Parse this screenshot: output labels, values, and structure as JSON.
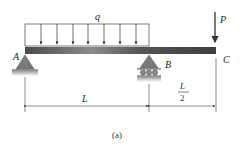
{
  "diagram": {
    "type": "beam-with-overhang",
    "distributed_load": {
      "label": "q",
      "from": "A",
      "to": "B"
    },
    "point_load": {
      "label": "P",
      "at": "C",
      "direction": "down"
    },
    "supports": [
      {
        "label": "A",
        "type": "pin"
      },
      {
        "label": "B",
        "type": "roller"
      }
    ],
    "free_end": {
      "label": "C"
    },
    "dimensions": [
      {
        "span": "A-B",
        "label": "L"
      },
      {
        "span": "B-C",
        "numerator": "L",
        "denominator": "2"
      }
    ],
    "caption": "(a)"
  },
  "colors": {
    "beam": "#555555",
    "beam_highlight": "#9a9a9a",
    "support": "#7a7a7a",
    "line": "#333333"
  }
}
